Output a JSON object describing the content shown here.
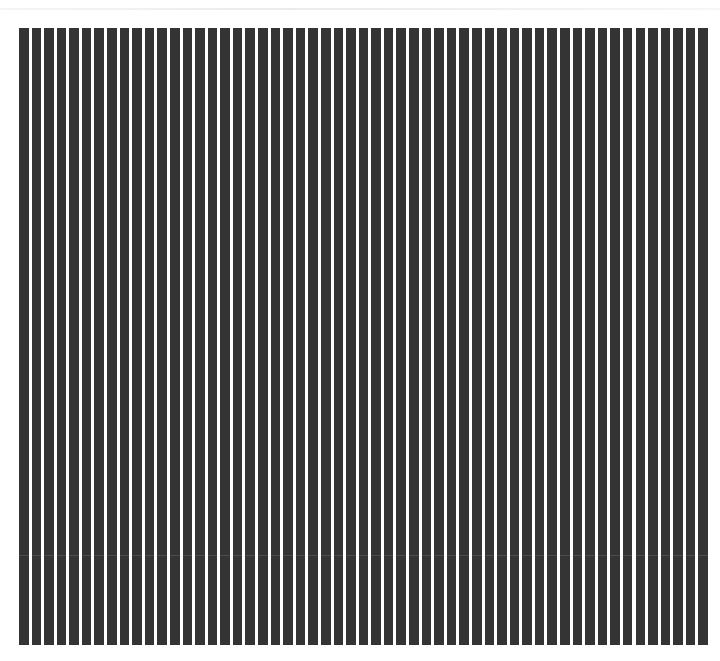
{
  "pattern": {
    "type": "vertical-square-wave-grating",
    "stripe_count": 55,
    "duty_cycle": 0.76,
    "stripe_color": "#343434",
    "background_color": "#ffffff"
  }
}
